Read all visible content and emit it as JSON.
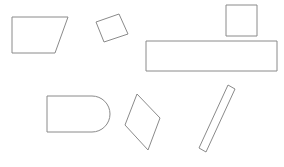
{
  "canvas": {
    "width": 284,
    "height": 167,
    "background_color": "#ffffff",
    "stroke_color": "#8a8a8a",
    "fill_color": "#ffffff",
    "stroke_width": 1,
    "shape_count": 7
  },
  "shapes": [
    {
      "id": "trapezoid",
      "name": "trapezoid",
      "type": "polygon",
      "points": "12,17 68,17 55,53 12,53",
      "label": "Trapezoid"
    },
    {
      "id": "rotated-rectangle",
      "name": "rotated-rectangle",
      "type": "polygon",
      "points": "96,22 119,14 128,34 104,42",
      "label": "Rotated rectangle"
    },
    {
      "id": "square",
      "name": "square",
      "type": "rect",
      "x": 226,
      "y": 5,
      "width": 31,
      "height": 31,
      "label": "Square"
    },
    {
      "id": "wide-rectangle",
      "name": "wide-rectangle",
      "type": "rect",
      "x": 146,
      "y": 41,
      "width": 131,
      "height": 30,
      "label": "Wide rectangle"
    },
    {
      "id": "rounded-end-rectangle",
      "name": "rounded-end-rectangle",
      "type": "path",
      "d": "M 47 96 L 92 96 A 18 18 0 0 1 92 132 L 47 132 Z",
      "label": "Rounded-end rectangle"
    },
    {
      "id": "kite",
      "name": "kite",
      "type": "polygon",
      "points": "137,94 160,118 148,150 125,125",
      "label": "Kite"
    },
    {
      "id": "tilted-bar",
      "name": "tilted-bar",
      "type": "polygon",
      "points": "228,85 235,89 206,152 199,148",
      "label": "Tilted bar"
    }
  ]
}
